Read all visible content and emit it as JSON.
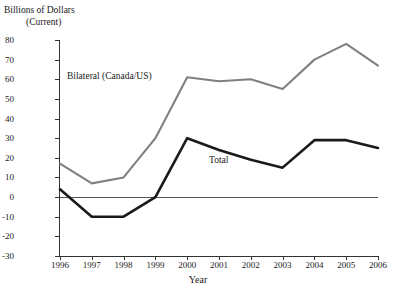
{
  "axis": {
    "ylabel_line1": "Billions of Dollars",
    "ylabel_line2": "(Current)",
    "xlabel": "Year"
  },
  "annotations": {
    "bilateral": "Bilateral (Canada/US)",
    "total": "Total"
  },
  "colors": {
    "bilateral_line": "#808080",
    "total_line": "#1a1a1a",
    "axis": "#333333",
    "zero_line": "#555555",
    "background": "#ffffff"
  },
  "chart_data": {
    "type": "line",
    "title": "",
    "subtitle": "",
    "xlabel": "Year",
    "ylabel": "Billions of Dollars (Current)",
    "categories": [
      "1996",
      "1997",
      "1998",
      "1999",
      "2000",
      "2001",
      "2002",
      "2003",
      "2004",
      "2005",
      "2006"
    ],
    "x": [
      1996,
      1997,
      1998,
      1999,
      2000,
      2001,
      2002,
      2003,
      2004,
      2005,
      2006
    ],
    "xlim": [
      1996,
      2006
    ],
    "ylim": [
      -30,
      80
    ],
    "ytick_labels": [
      "80",
      "70",
      "60",
      "50",
      "40",
      "30",
      "20",
      "10",
      "0",
      "-10",
      "-20",
      "-30"
    ],
    "yticks": [
      80,
      70,
      60,
      50,
      40,
      30,
      20,
      10,
      0,
      -10,
      -20,
      -30
    ],
    "ytick_step": 10,
    "grid": false,
    "legend": "inline-annotations",
    "zero_reference_line": 0,
    "series": [
      {
        "name": "Bilateral (Canada/US)",
        "color": "#808080",
        "values": [
          17,
          7,
          10,
          30,
          61,
          59,
          60,
          55,
          70,
          78,
          67
        ]
      },
      {
        "name": "Total",
        "color": "#1a1a1a",
        "values": [
          4,
          -10,
          -10,
          0,
          30,
          24,
          19,
          15,
          29,
          29,
          25
        ]
      }
    ]
  }
}
